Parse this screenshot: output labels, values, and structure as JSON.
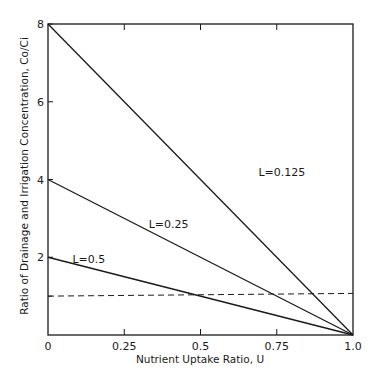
{
  "chart_data": {
    "type": "line",
    "title": "",
    "xlabel": "Nutrient Uptake Ratio, U",
    "ylabel": "Ratio of Drainage and Irrigation Concentration, Co/Ci",
    "xlim": [
      0,
      1.0
    ],
    "ylim": [
      0,
      8
    ],
    "grid": false,
    "legend": "none (inline line labels)",
    "x_ticks": [
      0,
      0.25,
      0.5,
      0.75,
      1.0
    ],
    "x_tick_labels": [
      "0",
      "0.25",
      "0.5",
      "0.75",
      "1.0"
    ],
    "y_ticks": [
      2,
      4,
      6,
      8
    ],
    "y_tick_labels": [
      "2",
      "4",
      "6",
      "8"
    ],
    "series": [
      {
        "name": "L=0.125",
        "style": "solid",
        "x": [
          0,
          1.0
        ],
        "y": [
          8,
          0
        ]
      },
      {
        "name": "L=0.25",
        "style": "solid",
        "x": [
          0,
          1.0
        ],
        "y": [
          4,
          0
        ]
      },
      {
        "name": "L=0.5",
        "style": "solid",
        "x": [
          0,
          1.0
        ],
        "y": [
          2,
          0
        ]
      },
      {
        "name": "reference (Co/Ci = 1)",
        "style": "dashed",
        "x": [
          0,
          1.0
        ],
        "y": [
          1.0,
          1.07
        ]
      }
    ],
    "annotations": [
      {
        "text": "L=0.125",
        "x": 0.69,
        "y": 4.1
      },
      {
        "text": "L=0.25",
        "x": 0.33,
        "y": 2.75
      },
      {
        "text": "L=0.5",
        "x": 0.08,
        "y": 1.85
      }
    ]
  }
}
